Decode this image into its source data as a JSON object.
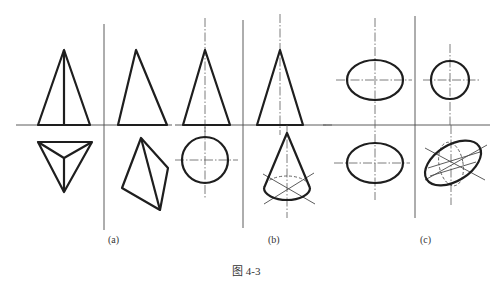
{
  "figure": {
    "caption": "图 4-3",
    "subfigures": [
      {
        "label": "(a)",
        "description": "Triangular pyramid: front view, side view, top view (triangle with center point), and an oblique quadrilateral view"
      },
      {
        "label": "(b)",
        "description": "Cone: front view triangle, side view triangle, top view circle, and an oblique pictorial cone with hidden base"
      },
      {
        "label": "(c)",
        "description": "Ellipses and circles: front view ellipse, side view circle, top view ellipse, and a tilted ellipse with construction lines"
      }
    ]
  },
  "colors": {
    "line": "#1e1e1e",
    "thin_line": "#4a4a4a",
    "background": "#ffffff"
  }
}
